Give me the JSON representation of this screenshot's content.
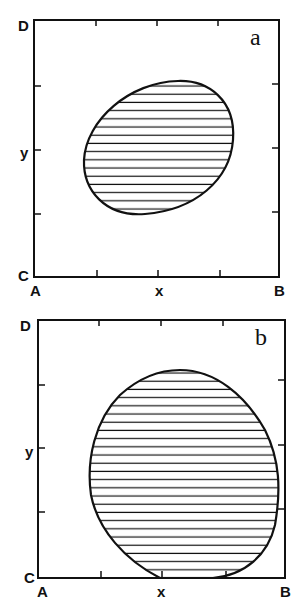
{
  "panels": [
    {
      "id": "a",
      "label": "a",
      "corner_labels": {
        "top_left": "D",
        "bottom_left_upper": "C",
        "bottom_left_lower": "A",
        "bottom_right": "B"
      },
      "axis_labels": {
        "x": "x",
        "y": "y"
      },
      "region": {
        "shape": "tilted-ellipse",
        "fill": "horizontal-hatch",
        "cx_frac": 0.52,
        "cy_frac": 0.53,
        "rx_frac": 0.24,
        "ry_frac": 0.28
      }
    },
    {
      "id": "b",
      "label": "b",
      "corner_labels": {
        "top_left": "D",
        "bottom_left_upper": "C",
        "bottom_left_lower": "A",
        "bottom_right": "B"
      },
      "axis_labels": {
        "x": "x",
        "y": "y"
      },
      "region": {
        "shape": "large-circle",
        "fill": "horizontal-hatch",
        "note": "touches bottom edge near x tick"
      }
    }
  ],
  "colors": {
    "line": "#111111",
    "background": "#ffffff"
  }
}
